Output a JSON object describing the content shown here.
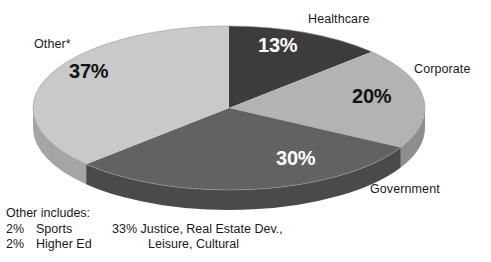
{
  "chart_data": {
    "type": "pie",
    "title": "",
    "subtitle": "",
    "xlabel": "",
    "ylabel": "",
    "legend_position": "none",
    "grid": false,
    "three_d": true,
    "start_angle_deg": 0,
    "direction": "clockwise",
    "categories": [
      "Healthcare",
      "Corporate",
      "Government",
      "Other*"
    ],
    "values": [
      13,
      20,
      30,
      37
    ],
    "value_labels": [
      "13%",
      "20%",
      "30%",
      "37%"
    ],
    "colors": [
      "#3c3c3c",
      "#b3b3b3",
      "#626262",
      "#c9c9c9"
    ],
    "side_colors": [
      "#2a2a2a",
      "#8e8e8e",
      "#4a4a4a",
      "#a5a5a5"
    ],
    "label_text_colors": [
      "#ffffff",
      "#111111",
      "#ffffff",
      "#111111"
    ],
    "slices": [
      {
        "name": "Healthcare",
        "value": 13,
        "label": "13%",
        "color": "#3c3c3c"
      },
      {
        "name": "Corporate",
        "value": 20,
        "label": "20%",
        "color": "#b3b3b3"
      },
      {
        "name": "Government",
        "value": 30,
        "label": "30%",
        "color": "#626262"
      },
      {
        "name": "Other*",
        "value": 37,
        "label": "37%",
        "color": "#c9c9c9"
      }
    ],
    "annotations": [
      "Other includes:",
      "2% Sports",
      "2% Higher Ed",
      "33% Justice, Real Estate Dev., Leisure, Cultural"
    ]
  },
  "labels": {
    "healthcare": "Healthcare",
    "corporate": "Corporate",
    "government": "Government",
    "other": "Other*"
  },
  "percents": {
    "healthcare": "13%",
    "corporate": "20%",
    "government": "30%",
    "other": "37%"
  },
  "footnote": {
    "title": "Other includes:",
    "rows": [
      {
        "pct": "2%",
        "name": "Sports"
      },
      {
        "pct": "2%",
        "name": "Higher Ed"
      }
    ],
    "right_line1": "33% Justice, Real Estate Dev.,",
    "right_line2": "Leisure, Cultural"
  }
}
